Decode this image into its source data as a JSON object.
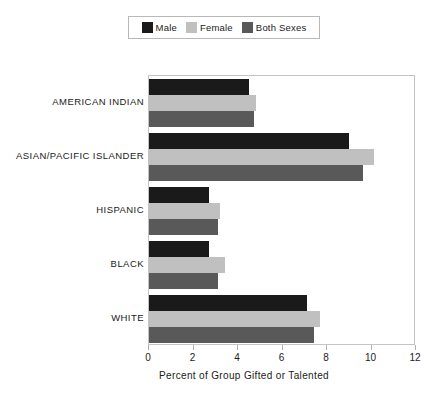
{
  "legend": {
    "position": "top-center",
    "entries": [
      {
        "label": "Male",
        "color": "#1a1a1a"
      },
      {
        "label": "Female",
        "color": "#c0c0c0"
      },
      {
        "label": "Both Sexes",
        "color": "#595959"
      }
    ]
  },
  "chart_data": {
    "type": "bar",
    "orientation": "horizontal",
    "title": "",
    "xlabel": "Percent of Group Gifted or Talented",
    "ylabel": "",
    "xlim": [
      0,
      12
    ],
    "xticks": [
      "0",
      "2",
      "4",
      "6",
      "8",
      "10",
      "12"
    ],
    "xtick_values": [
      0,
      2,
      4,
      6,
      8,
      10,
      12
    ],
    "grid": false,
    "legend_position": "top",
    "categories": [
      "AMERICAN INDIAN",
      "ASIAN/PACIFIC ISLANDER",
      "HISPANIC",
      "BLACK",
      "WHITE"
    ],
    "series": [
      {
        "name": "Male",
        "color": "#1a1a1a",
        "values": [
          4.5,
          9.0,
          2.7,
          2.7,
          7.1
        ]
      },
      {
        "name": "Female",
        "color": "#c0c0c0",
        "values": [
          4.8,
          10.1,
          3.2,
          3.4,
          7.7
        ]
      },
      {
        "name": "Both Sexes",
        "color": "#595959",
        "values": [
          4.7,
          9.6,
          3.1,
          3.1,
          7.4
        ]
      }
    ]
  }
}
